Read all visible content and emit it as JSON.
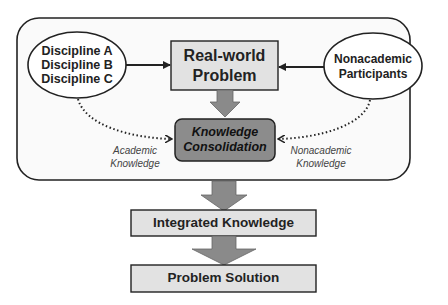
{
  "nodes": {
    "disciplines": {
      "lines": [
        "Discipline A",
        "Discipline B",
        "Discipline C"
      ]
    },
    "real_world_problem": {
      "lines": [
        "Real-world",
        "Problem"
      ]
    },
    "nonacademic_participants": {
      "lines": [
        "Nonacademic",
        "Participants"
      ]
    },
    "knowledge_consolidation": {
      "lines": [
        "Knowledge",
        "Consolidation"
      ]
    },
    "integrated_knowledge": {
      "label": "Integrated Knowledge"
    },
    "problem_solution": {
      "label": "Problem Solution"
    }
  },
  "edge_labels": {
    "academic_knowledge": {
      "lines": [
        "Academic",
        "Knowledge"
      ]
    },
    "nonacademic_knowledge": {
      "lines": [
        "Nonacademic",
        "Knowledge"
      ]
    }
  },
  "colors": {
    "container_fill": "#fafafa",
    "box_fill": "#e2e2e2",
    "consolidation_fill": "#8c8c8c",
    "arrow_fill": "#8a8a8a",
    "stroke": "#222222"
  }
}
